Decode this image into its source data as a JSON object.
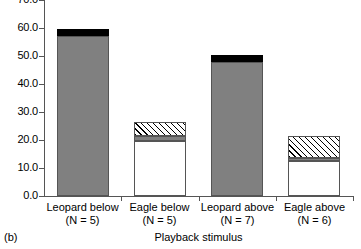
{
  "chart_data": {
    "type": "bar",
    "title": "",
    "panel_label": "(b)",
    "xlabel": "Playback stimulus",
    "ylabel": "",
    "ylim": [
      0,
      70
    ],
    "ytick_values": [
      0,
      10,
      20,
      30,
      40,
      50,
      60,
      70
    ],
    "ytick_labels": [
      "0.0",
      "10.0",
      "20.0",
      "30.0",
      "40.0",
      "50.0",
      "60.0",
      "70.0"
    ],
    "grid": false,
    "legend_position": "none",
    "stacked": true,
    "categories": [
      "Leopard below",
      "Eagle below",
      "Leopard above",
      "Eagle above"
    ],
    "category_sublabels": [
      "(N = 5)",
      "(N = 5)",
      "(N = 7)",
      "(N = 6)"
    ],
    "series": [
      {
        "name": "gray",
        "fill": "solid-gray",
        "values": [
          57.0,
          1.9,
          48.0,
          1.1
        ]
      },
      {
        "name": "hatched",
        "fill": "hatch",
        "values": [
          0.0,
          5.0,
          0.0,
          7.8
        ]
      },
      {
        "name": "black",
        "fill": "solid-black",
        "values": [
          2.5,
          0.0,
          2.4,
          0.0
        ]
      }
    ],
    "bars": [
      {
        "category": "Leopard below",
        "sublabel": "(N = 5)",
        "total": 59.5,
        "segments": [
          {
            "fill": "solid-gray",
            "from": 0.0,
            "to": 57.0
          },
          {
            "fill": "solid-black",
            "from": 57.0,
            "to": 59.5
          }
        ]
      },
      {
        "category": "Eagle below",
        "sublabel": "(N = 5)",
        "total": 26.5,
        "segments": [
          {
            "fill": "white",
            "from": 0.0,
            "to": 19.6
          },
          {
            "fill": "solid-gray",
            "from": 19.6,
            "to": 21.5
          },
          {
            "fill": "hatch",
            "from": 21.5,
            "to": 26.5
          }
        ]
      },
      {
        "category": "Leopard above",
        "sublabel": "(N = 7)",
        "total": 50.4,
        "segments": [
          {
            "fill": "solid-gray",
            "from": 0.0,
            "to": 48.0
          },
          {
            "fill": "solid-black",
            "from": 48.0,
            "to": 50.4
          }
        ]
      },
      {
        "category": "Eagle above",
        "sublabel": "(N = 6)",
        "total": 21.4,
        "segments": [
          {
            "fill": "white",
            "from": 0.0,
            "to": 12.5
          },
          {
            "fill": "solid-gray",
            "from": 12.5,
            "to": 13.6
          },
          {
            "fill": "hatch",
            "from": 13.6,
            "to": 21.4
          }
        ]
      }
    ],
    "colors": {
      "gray": "#808080",
      "black": "#000000",
      "white": "#ffffff",
      "axis": "#555555",
      "text": "#000000"
    }
  }
}
